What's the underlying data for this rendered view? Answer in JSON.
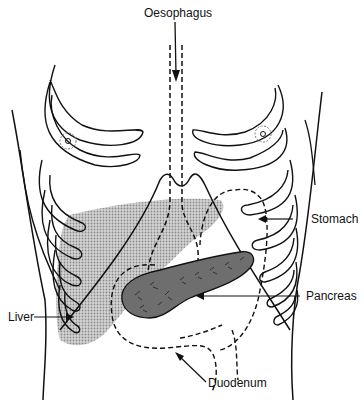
{
  "diagram": {
    "labels": {
      "oesophagus": "Oesophagus",
      "stomach": "Stomach",
      "pancreas": "Pancreas",
      "liver": "Liver",
      "duodenum": "Duodenum"
    },
    "colors": {
      "line": "#111111",
      "liver_fill": "#bdbdbd",
      "pancreas_fill": "#6e6e6e",
      "background": "#ffffff"
    }
  }
}
